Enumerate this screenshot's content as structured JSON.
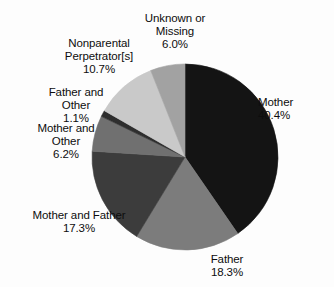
{
  "chart_data": {
    "type": "pie",
    "title": "",
    "xlabel": "",
    "ylabel": "",
    "legend_position": "labels-outside",
    "grid": false,
    "units": "percent",
    "start_angle_deg": 0,
    "direction": "clockwise",
    "categories": [
      "Mother",
      "Father",
      "Mother and Father",
      "Mother and Other",
      "Father and Other",
      "Nonparental Perpetrator[s]",
      "Unknown or Missing"
    ],
    "values": [
      40.4,
      18.3,
      17.3,
      6.2,
      1.1,
      10.7,
      6.0
    ],
    "slices": [
      {
        "name": "Mother",
        "label_line1": "Mother",
        "label_line2": "40.4%",
        "value": 40.4,
        "color": "#141414",
        "start_deg": 0,
        "end_deg": 145.44
      },
      {
        "name": "Father",
        "label_line1": "Father",
        "label_line2": "18.3%",
        "value": 18.3,
        "color": "#7c7c7c",
        "start_deg": 145.44,
        "end_deg": 211.32
      },
      {
        "name": "Mother and Father",
        "label_line1": "Mother and Father",
        "label_line2": "17.3%",
        "value": 17.3,
        "color": "#3c3c3c",
        "start_deg": 211.32,
        "end_deg": 273.6
      },
      {
        "name": "Mother and Other",
        "label_line1": "Mother and",
        "label_line2": "Other",
        "label_line3": "6.2%",
        "value": 6.2,
        "color": "#707070",
        "start_deg": 273.6,
        "end_deg": 295.92
      },
      {
        "name": "Father and Other",
        "label_line1": "Father and",
        "label_line2": "Other",
        "label_line3": "1.1%",
        "value": 1.1,
        "color": "#2e2e2e",
        "start_deg": 295.92,
        "end_deg": 299.88
      },
      {
        "name": "Nonparental Perpetrator[s]",
        "label_line1": "Nonparental",
        "label_line2": "Perpetrator[s]",
        "label_line3": "10.7%",
        "value": 10.7,
        "color": "#c9c9c9",
        "start_deg": 299.88,
        "end_deg": 338.4
      },
      {
        "name": "Unknown or Missing",
        "label_line1": "Unknown or",
        "label_line2": "Missing",
        "label_line3": "6.0%",
        "value": 6.0,
        "color": "#a2a2a2",
        "start_deg": 338.4,
        "end_deg": 360
      }
    ]
  },
  "labels": {
    "unknown_missing": "Unknown or\nMissing\n6.0%",
    "nonparental": "Nonparental\nPerpetrator[s]\n10.7%",
    "father_and_other": "Father and\nOther\n1.1%",
    "mother_and_other": "Mother and\nOther\n6.2%",
    "mother_and_father": "Mother and Father\n17.3%",
    "father": "Father\n18.3%",
    "mother": "Mother\n40.4%"
  },
  "geometry": {
    "center_x": 185,
    "center_y": 157,
    "radius": 93
  },
  "colors": {
    "background": "#fdfdfd",
    "text": "#0d0d0d",
    "outline": "#111111"
  }
}
